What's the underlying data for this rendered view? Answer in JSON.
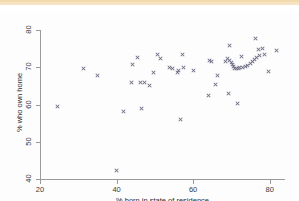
{
  "figure": {
    "background_color": "#ffffff",
    "top_band_color": "#f6e3c3",
    "marker_color": "#6f6f86",
    "axis_color": "#9a9a96"
  },
  "chart_data": {
    "type": "scatter",
    "title": "",
    "xlabel": "% born in state of residence",
    "ylabel": "% who own home",
    "xlim": [
      20,
      84
    ],
    "ylim": [
      40,
      80
    ],
    "xticks": [
      20,
      40,
      60,
      80
    ],
    "yticks": [
      40,
      50,
      60,
      70,
      80
    ],
    "grid": false,
    "legend": null,
    "marker": "x",
    "points": [
      {
        "x": 24.5,
        "y": 59.4
      },
      {
        "x": 31.3,
        "y": 69.6
      },
      {
        "x": 34.9,
        "y": 67.8
      },
      {
        "x": 39.9,
        "y": 42.4
      },
      {
        "x": 41.7,
        "y": 58.2
      },
      {
        "x": 43.9,
        "y": 65.9
      },
      {
        "x": 44.2,
        "y": 70.7
      },
      {
        "x": 45.4,
        "y": 72.6
      },
      {
        "x": 46.2,
        "y": 65.9
      },
      {
        "x": 46.5,
        "y": 58.8
      },
      {
        "x": 47.4,
        "y": 65.9
      },
      {
        "x": 48.6,
        "y": 65.2
      },
      {
        "x": 49.7,
        "y": 68.5
      },
      {
        "x": 50.7,
        "y": 73.4
      },
      {
        "x": 51.6,
        "y": 72.4
      },
      {
        "x": 53.8,
        "y": 70.0
      },
      {
        "x": 54.5,
        "y": 69.6
      },
      {
        "x": 55.9,
        "y": 68.6
      },
      {
        "x": 56.3,
        "y": 69.0
      },
      {
        "x": 56.8,
        "y": 55.9
      },
      {
        "x": 57.2,
        "y": 73.3
      },
      {
        "x": 57.4,
        "y": 69.8
      },
      {
        "x": 60.1,
        "y": 69.0
      },
      {
        "x": 63.9,
        "y": 62.3
      },
      {
        "x": 64.3,
        "y": 71.9
      },
      {
        "x": 64.7,
        "y": 71.5
      },
      {
        "x": 65.9,
        "y": 65.3
      },
      {
        "x": 66.4,
        "y": 67.7
      },
      {
        "x": 68.4,
        "y": 71.5
      },
      {
        "x": 69.0,
        "y": 72.3
      },
      {
        "x": 69.2,
        "y": 62.9
      },
      {
        "x": 69.5,
        "y": 75.9
      },
      {
        "x": 69.6,
        "y": 71.8
      },
      {
        "x": 69.9,
        "y": 71.3
      },
      {
        "x": 70.2,
        "y": 70.8
      },
      {
        "x": 70.5,
        "y": 70.2
      },
      {
        "x": 70.9,
        "y": 69.7
      },
      {
        "x": 71.3,
        "y": 69.6
      },
      {
        "x": 71.5,
        "y": 60.2
      },
      {
        "x": 71.8,
        "y": 69.6
      },
      {
        "x": 72.2,
        "y": 69.8
      },
      {
        "x": 72.6,
        "y": 73.0
      },
      {
        "x": 73.0,
        "y": 70.0
      },
      {
        "x": 73.6,
        "y": 70.3
      },
      {
        "x": 74.3,
        "y": 70.6
      },
      {
        "x": 75.0,
        "y": 71.1
      },
      {
        "x": 75.6,
        "y": 71.6
      },
      {
        "x": 76.1,
        "y": 72.2
      },
      {
        "x": 76.3,
        "y": 77.6
      },
      {
        "x": 76.6,
        "y": 72.7
      },
      {
        "x": 77.0,
        "y": 74.8
      },
      {
        "x": 77.3,
        "y": 73.2
      },
      {
        "x": 78.1,
        "y": 75.0
      },
      {
        "x": 78.6,
        "y": 73.4
      },
      {
        "x": 79.8,
        "y": 68.8
      },
      {
        "x": 81.8,
        "y": 74.5
      }
    ]
  }
}
